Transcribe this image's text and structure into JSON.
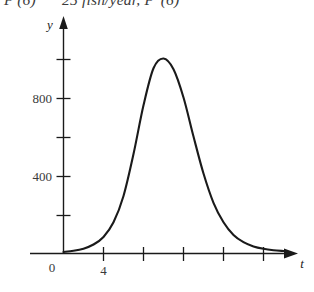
{
  "page": {
    "background": "#ffffff",
    "ink": "#1a1a1a"
  },
  "top_line": {
    "visible_fragment": "P'(6) ≈ 25 fish/year, P''(6)",
    "part1": "P′(6)",
    "part2": "25 fish/year, P″(6)",
    "note": "partially cropped line of text at top edge"
  },
  "figure": {
    "axes": {
      "x_label": "t",
      "y_label": "y",
      "origin_label": "0",
      "x_axis_color": "#1a1a1a",
      "y_axis_color": "#1a1a1a"
    },
    "x_ticks": [
      {
        "value": "4",
        "labeled": true
      },
      {
        "value": "8",
        "labeled": false
      },
      {
        "value": "12",
        "labeled": false
      },
      {
        "value": "16",
        "labeled": false
      },
      {
        "value": "20",
        "labeled": false
      }
    ],
    "y_ticks": [
      {
        "value": "1000",
        "labeled": false
      },
      {
        "value": "800",
        "labeled": true
      },
      {
        "value": "600",
        "labeled": false
      },
      {
        "value": "400",
        "labeled": true
      },
      {
        "value": "200",
        "labeled": false
      }
    ]
  },
  "chart_data": {
    "type": "line",
    "title": "",
    "xlabel": "t",
    "ylabel": "y",
    "xlim": [
      0,
      22
    ],
    "ylim": [
      0,
      1150
    ],
    "grid": false,
    "legend": null,
    "x_tick_values": [
      4,
      8,
      12,
      16,
      20
    ],
    "x_tick_labels": [
      "4",
      "",
      "",
      "",
      ""
    ],
    "y_tick_values": [
      200,
      400,
      600,
      800,
      1000
    ],
    "y_tick_labels": [
      "",
      "400",
      "",
      "800",
      ""
    ],
    "annotations": [
      "0"
    ],
    "series": [
      {
        "name": "y",
        "peak_x": 10,
        "peak_y": 1000,
        "x": [
          0,
          1,
          2,
          3,
          4,
          5,
          6,
          7,
          8,
          9,
          10,
          11,
          12,
          13,
          14,
          15,
          16,
          17,
          18,
          19,
          20,
          21,
          22
        ],
        "values": [
          8,
          14,
          25,
          46,
          85,
          160,
          295,
          510,
          760,
          950,
          1000,
          945,
          800,
          600,
          410,
          260,
          160,
          95,
          58,
          36,
          24,
          17,
          13
        ]
      }
    ]
  }
}
